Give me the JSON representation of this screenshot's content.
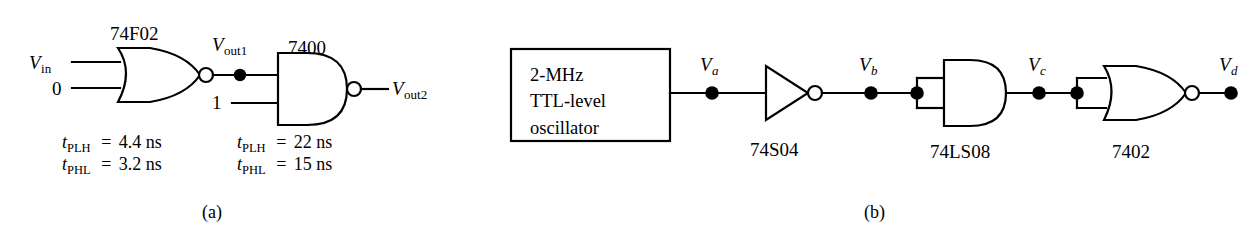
{
  "figure": {
    "subfigures": [
      {
        "caption": "(a)",
        "gates": [
          {
            "name": "nor-gate-74f02",
            "type": "NOR",
            "part_number": "74F02",
            "inputs": [
              "V_in",
              "0"
            ],
            "output": "V_out1",
            "timing": {
              "tplh": "4.4 ns",
              "tphl": "3.2 ns"
            }
          },
          {
            "name": "nand-gate-7400",
            "type": "NAND",
            "part_number": "7400",
            "inputs": [
              "V_out1",
              "1"
            ],
            "output": "V_out2",
            "timing": {
              "tplh": "22 ns",
              "tphl": "15 ns"
            }
          }
        ],
        "labels": {
          "vin": "V",
          "vin_sub": "in",
          "zero": "0",
          "one": "1",
          "vout1": "V",
          "vout1_sub": "out1",
          "vout2": "V",
          "vout2_sub": "out2",
          "chip1": "74F02",
          "chip2": "7400",
          "t_symbol": "t",
          "plh_sub": "PLH",
          "phl_sub": "PHL",
          "eq": "=",
          "g1_tplh_value": "4.4 ns",
          "g1_tphl_value": "3.2 ns",
          "g2_tplh_value": "22 ns",
          "g2_tphl_value": "15 ns"
        }
      },
      {
        "caption": "(b)",
        "source": {
          "name": "oscillator-block",
          "line1": "2-MHz",
          "line2": "TTL-level",
          "line3": "oscillator"
        },
        "gates": [
          {
            "name": "inverter-74s04",
            "type": "INVERTER",
            "part_number": "74S04",
            "input_node": "V_a",
            "output_node": "V_b"
          },
          {
            "name": "and-gate-74ls08",
            "type": "AND",
            "part_number": "74LS08",
            "input_node": "V_b",
            "output_node": "V_c",
            "inputs_tied": true
          },
          {
            "name": "nor-gate-7402",
            "type": "NOR",
            "part_number": "7402",
            "input_node": "V_c",
            "output_node": "V_d",
            "inputs_tied": true
          }
        ],
        "labels": {
          "va": "V",
          "va_sub": "a",
          "vb": "V",
          "vb_sub": "b",
          "vc": "V",
          "vc_sub": "c",
          "vd": "V",
          "vd_sub": "d",
          "chip_inv": "74S04",
          "chip_and": "74LS08",
          "chip_nor": "7402"
        }
      }
    ]
  },
  "style": {
    "line_color": "#000000",
    "text_color": "#000000",
    "background": "#ffffff",
    "bubble_fill": "#ffffff",
    "junction_fill": "#000000"
  }
}
